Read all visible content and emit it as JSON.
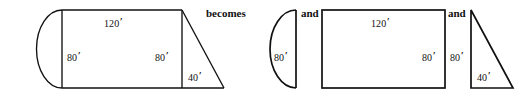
{
  "figure": {
    "unit_symbol": "′",
    "stroke_color": "#111111",
    "background_color": "#ffffff",
    "connectors": [
      {
        "label": "becomes"
      },
      {
        "label": "and"
      },
      {
        "label": "and"
      }
    ],
    "composite": {
      "name": "composite-figure",
      "labels": {
        "top_length": "120",
        "left_height": "80",
        "right_height": "80",
        "triangle_base": "40"
      },
      "parts": [
        "semicircle-end",
        "rectangle-body",
        "right-triangle-end"
      ]
    },
    "pieces": [
      {
        "name": "semicircle-piece",
        "shape": "semicircle",
        "labels": {
          "diameter": "80"
        }
      },
      {
        "name": "rectangle-piece",
        "shape": "rectangle",
        "labels": {
          "width": "120",
          "height": "80"
        }
      },
      {
        "name": "triangle-piece",
        "shape": "right-triangle",
        "labels": {
          "height": "80",
          "base": "40"
        }
      }
    ]
  }
}
